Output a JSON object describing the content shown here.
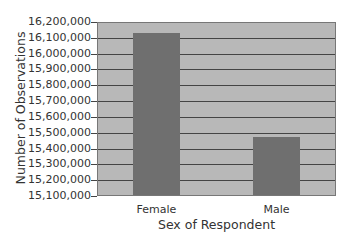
{
  "chart_data": {
    "type": "bar",
    "title": "",
    "xlabel": "Sex of Respondent",
    "ylabel": "Number of Observations",
    "categories": [
      "Female",
      "Male"
    ],
    "values": [
      16130000,
      15475000
    ],
    "ylim": [
      15100000,
      16200000
    ],
    "yticks": [
      15100000,
      15200000,
      15300000,
      15400000,
      15500000,
      15600000,
      15700000,
      15800000,
      15900000,
      16000000,
      16100000,
      16200000
    ],
    "ytick_labels": [
      "15,100,000",
      "15,200,000",
      "15,300,000",
      "15,400,000",
      "15,500,000",
      "15,600,000",
      "15,700,000",
      "15,800,000",
      "15,900,000",
      "16,000,000",
      "16,100,000",
      "16,200,000"
    ],
    "grid": true,
    "legend": null,
    "colors": {
      "bar": "#6f6f6f",
      "plot_background": "#b8b8b8",
      "gridline": "#444444"
    }
  }
}
